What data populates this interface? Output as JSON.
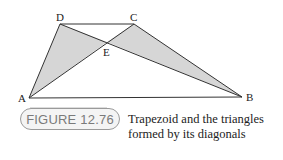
{
  "figure": {
    "vertices": {
      "A": {
        "label": "A",
        "x": 29,
        "y": 98
      },
      "B": {
        "label": "B",
        "x": 242,
        "y": 97
      },
      "C": {
        "label": "C",
        "x": 134,
        "y": 24
      },
      "D": {
        "label": "D",
        "x": 60,
        "y": 24
      },
      "E": {
        "label": "E",
        "x": 107,
        "y": 42
      }
    },
    "shaded_triangles": [
      "ADE",
      "BCE"
    ],
    "colors": {
      "shade": "#d6d6d6",
      "line": "#333333"
    }
  },
  "badge": {
    "label": "FIGURE 12.76"
  },
  "caption": {
    "line1": "Trapezoid and the triangles",
    "line2": "formed by its diagonals"
  }
}
